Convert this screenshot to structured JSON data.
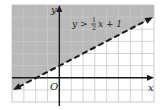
{
  "chart_data": {
    "type": "line",
    "title": "",
    "inequality_label": "y > ½x + 1",
    "label_parts": {
      "lhs": "y >",
      "num": "1",
      "den": "2",
      "rhs": "x + 1"
    },
    "xlabel": "x",
    "ylabel": "y",
    "origin_label": "O",
    "xlim": [
      -4,
      8
    ],
    "ylim": [
      -2,
      6
    ],
    "grid": true,
    "boundary": {
      "slope": 0.5,
      "intercept": 1,
      "style": "dashed",
      "arrows": "both"
    },
    "series": [
      {
        "name": "y = 1/2x + 1",
        "x": [
          -4,
          8
        ],
        "y": [
          -1,
          5
        ]
      }
    ],
    "shaded_region": "above",
    "colors": {
      "shade": "#b9b9b9",
      "grid": "#c8c8c8",
      "axis": "#1a1a1a",
      "line": "#1a1a1a"
    }
  }
}
